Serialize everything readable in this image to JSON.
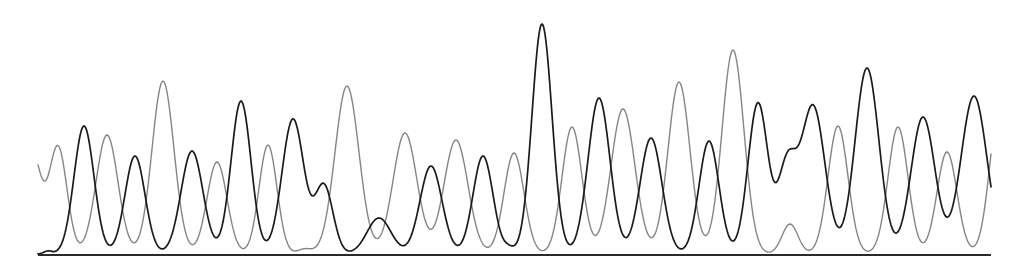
{
  "chart_data": {
    "type": "line",
    "title": "",
    "subtitle": "",
    "xlabel": "",
    "ylabel": "",
    "grid": false,
    "legend": null,
    "canvas": {
      "width": 1026,
      "height": 280
    },
    "baseline": {
      "x_start": 38,
      "x_end": 991,
      "y": 255,
      "color": "#2a2a2a"
    },
    "x_range": [
      38,
      991
    ],
    "y_units": "pixel height above baseline",
    "series": [
      {
        "name": "black-trace",
        "color": "#1a1a1a",
        "stroke_width": 1.7,
        "peaks": [
          {
            "x": 48,
            "height": 3,
            "width": 4
          },
          {
            "x": 84,
            "height": 128,
            "width": 10
          },
          {
            "x": 135,
            "height": 98,
            "width": 10
          },
          {
            "x": 192,
            "height": 103,
            "width": 11
          },
          {
            "x": 241,
            "height": 153,
            "width": 10
          },
          {
            "x": 293,
            "height": 135,
            "width": 11
          },
          {
            "x": 324,
            "height": 68,
            "width": 9
          },
          {
            "x": 379,
            "height": 36,
            "width": 12
          },
          {
            "x": 431,
            "height": 88,
            "width": 11
          },
          {
            "x": 483,
            "height": 98,
            "width": 10
          },
          {
            "x": 509,
            "height": 5,
            "width": 5
          },
          {
            "x": 542,
            "height": 230,
            "width": 10
          },
          {
            "x": 599,
            "height": 156,
            "width": 11
          },
          {
            "x": 651,
            "height": 116,
            "width": 11
          },
          {
            "x": 709,
            "height": 113,
            "width": 10
          },
          {
            "x": 758,
            "height": 151,
            "width": 10
          },
          {
            "x": 787,
            "height": 85,
            "width": 9
          },
          {
            "x": 813,
            "height": 148,
            "width": 12
          },
          {
            "x": 867,
            "height": 186,
            "width": 12
          },
          {
            "x": 923,
            "height": 137,
            "width": 12
          },
          {
            "x": 974,
            "height": 158,
            "width": 13
          }
        ],
        "end_point": {
          "x": 991,
          "y": 190
        }
      },
      {
        "name": "gray-trace",
        "color": "#858585",
        "stroke_width": 1.4,
        "start_point": {
          "x": 38,
          "y": 185
        },
        "peaks": [
          {
            "x": 32,
            "height": 100,
            "width": 9
          },
          {
            "x": 58,
            "height": 107,
            "width": 9
          },
          {
            "x": 107,
            "height": 119,
            "width": 11
          },
          {
            "x": 163,
            "height": 173,
            "width": 11
          },
          {
            "x": 217,
            "height": 92,
            "width": 10
          },
          {
            "x": 268,
            "height": 109,
            "width": 9
          },
          {
            "x": 305,
            "height": 5,
            "width": 7
          },
          {
            "x": 347,
            "height": 168,
            "width": 12
          },
          {
            "x": 405,
            "height": 121,
            "width": 12
          },
          {
            "x": 456,
            "height": 114,
            "width": 12
          },
          {
            "x": 514,
            "height": 101,
            "width": 10
          },
          {
            "x": 572,
            "height": 127,
            "width": 10
          },
          {
            "x": 623,
            "height": 145,
            "width": 12
          },
          {
            "x": 679,
            "height": 172,
            "width": 11
          },
          {
            "x": 733,
            "height": 204,
            "width": 11
          },
          {
            "x": 790,
            "height": 30,
            "width": 8
          },
          {
            "x": 838,
            "height": 128,
            "width": 10
          },
          {
            "x": 898,
            "height": 127,
            "width": 10
          },
          {
            "x": 947,
            "height": 102,
            "width": 10
          },
          {
            "x": 1000,
            "height": 150,
            "width": 10
          }
        ],
        "end_point": {
          "x": 991,
          "y": 118
        }
      }
    ]
  }
}
